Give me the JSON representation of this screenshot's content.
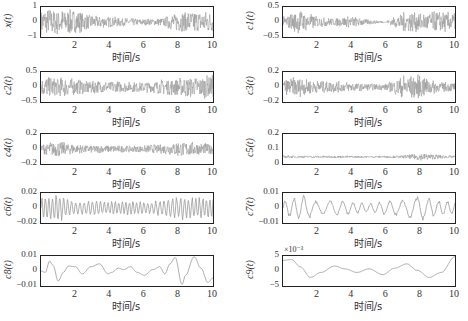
{
  "chart_data": [
    {
      "id": "x",
      "type": "line",
      "ylabel": "x(t)",
      "yticks": [
        "1",
        "0",
        "-1"
      ],
      "ylim": [
        -1,
        1
      ],
      "xlabel": "时间/s",
      "xticks": [
        "2",
        "4",
        "6",
        "8",
        "10"
      ],
      "xlim": [
        0,
        10
      ],
      "noise": 0.8,
      "kind": "noise",
      "env": [
        1,
        1,
        0.9,
        0.5,
        0.4,
        0.3,
        0.25,
        0.3,
        0.8,
        0.9,
        0.8
      ]
    },
    {
      "id": "c1",
      "type": "line",
      "ylabel": "c1(t)",
      "yticks": [
        "0.5",
        "0",
        "-0.5"
      ],
      "ylim": [
        -0.5,
        0.5
      ],
      "xlabel": "时间/s",
      "xticks": [
        "2",
        "4",
        "6",
        "8",
        "10"
      ],
      "xlim": [
        0,
        10
      ],
      "kind": "noise",
      "env": [
        0.4,
        0.9,
        0.4,
        0.3,
        0.45,
        0.2,
        0.05,
        0.8,
        0.7,
        0.8,
        0.7
      ]
    },
    {
      "id": "c2",
      "type": "line",
      "ylabel": "c2(t)",
      "yticks": [
        "0.5",
        "0",
        "-0.5"
      ],
      "ylim": [
        -0.5,
        0.5
      ],
      "xlabel": "时间/s",
      "xticks": [
        "2",
        "4",
        "6",
        "8",
        "10"
      ],
      "xlim": [
        0,
        10
      ],
      "kind": "noise",
      "env": [
        0.7,
        0.8,
        0.6,
        0.5,
        0.45,
        0.4,
        0.4,
        0.55,
        0.7,
        0.8,
        0.9
      ]
    },
    {
      "id": "c3",
      "type": "line",
      "ylabel": "c3(t)",
      "yticks": [
        "0.2",
        "0",
        "-0.2"
      ],
      "ylim": [
        -0.2,
        0.2
      ],
      "xlabel": "时间/s",
      "xticks": [
        "2",
        "4",
        "6",
        "8",
        "10"
      ],
      "xlim": [
        0,
        10
      ],
      "kind": "noise",
      "env": [
        0.6,
        0.8,
        0.5,
        0.45,
        0.35,
        0.25,
        0.25,
        0.9,
        0.9,
        0.4,
        0.35
      ]
    },
    {
      "id": "c4",
      "type": "line",
      "ylabel": "c4(t)",
      "yticks": [
        "0.2",
        "0",
        "-0.2"
      ],
      "ylim": [
        -0.2,
        0.2
      ],
      "xlabel": "时间/s",
      "xticks": [
        "2",
        "4",
        "6",
        "8",
        "10"
      ],
      "xlim": [
        0,
        10
      ],
      "kind": "noise",
      "env": [
        0.4,
        0.6,
        0.35,
        0.3,
        0.3,
        0.25,
        0.3,
        0.35,
        0.6,
        0.5,
        0.4
      ]
    },
    {
      "id": "c5",
      "type": "line",
      "ylabel": "c5(t)",
      "yticks": [
        "0.2",
        "0.1",
        "0"
      ],
      "ylim": [
        0,
        0.2
      ],
      "xlabel": "时间/s",
      "xticks": [
        "2",
        "4",
        "6",
        "8",
        "10"
      ],
      "xlim": [
        0,
        10
      ],
      "kind": "noise_offset",
      "offset": 0.045,
      "env": [
        0.2,
        0.15,
        0.15,
        0.15,
        0.15,
        0.12,
        0.15,
        0.2,
        0.5,
        0.3,
        0.15
      ]
    },
    {
      "id": "c6",
      "type": "line",
      "ylabel": "c6(t)",
      "yticks": [
        "0.02",
        "0",
        "-0.02"
      ],
      "ylim": [
        -0.02,
        0.02
      ],
      "xlabel": "时间/s",
      "xticks": [
        "2",
        "4",
        "6",
        "8",
        "10"
      ],
      "xlim": [
        0,
        10
      ],
      "kind": "osc",
      "freq": 4.5,
      "env": [
        0.9,
        1,
        0.5,
        0.55,
        0.5,
        0.5,
        0.45,
        0.6,
        0.9,
        0.8,
        0.85
      ]
    },
    {
      "id": "c7",
      "type": "line",
      "ylabel": "c7(t)",
      "yticks": [
        "0.01",
        "0",
        "-0.01"
      ],
      "ylim": [
        -0.01,
        0.01
      ],
      "xlabel": "时间/s",
      "xticks": [
        "2",
        "4",
        "6",
        "8",
        "10"
      ],
      "xlim": [
        0,
        10
      ],
      "kind": "osc",
      "freq": 1.6,
      "env": [
        0.5,
        1,
        0.5,
        0.6,
        0.45,
        0.35,
        0.55,
        0.6,
        0.95,
        0.6,
        0.5
      ]
    },
    {
      "id": "c8",
      "type": "line",
      "ylabel": "c8(t)",
      "yticks": [
        "0.01",
        "0",
        "-0.01"
      ],
      "ylim": [
        -0.01,
        0.01
      ],
      "xlabel": "时间/s",
      "xticks": [
        "2",
        "4",
        "6",
        "8",
        "10"
      ],
      "xlim": [
        0,
        10
      ],
      "kind": "points",
      "pts": [
        [
          0,
          0
        ],
        [
          0.25,
          -0.1
        ],
        [
          0.5,
          0.7
        ],
        [
          0.7,
          0.4
        ],
        [
          1.0,
          -0.7
        ],
        [
          1.3,
          -0.1
        ],
        [
          1.6,
          0.35
        ],
        [
          2.0,
          0.3
        ],
        [
          2.4,
          -0.2
        ],
        [
          2.9,
          0.3
        ],
        [
          3.4,
          0.5
        ],
        [
          3.9,
          -0.2
        ],
        [
          4.1,
          -0.1
        ],
        [
          4.5,
          0.2
        ],
        [
          4.8,
          0.1
        ],
        [
          5.2,
          0.3
        ],
        [
          5.6,
          -0.1
        ],
        [
          6.0,
          -0.3
        ],
        [
          6.5,
          0.1
        ],
        [
          6.9,
          0.3
        ],
        [
          7.2,
          -0.2
        ],
        [
          7.5,
          0.5
        ],
        [
          7.8,
          0.95
        ],
        [
          8.2,
          -0.95
        ],
        [
          8.4,
          -0.3
        ],
        [
          8.9,
          1.0
        ],
        [
          9.3,
          0.2
        ],
        [
          9.7,
          -0.8
        ],
        [
          10,
          -0.5
        ]
      ]
    },
    {
      "id": "c9",
      "type": "line",
      "ylabel": "c9(t)",
      "yticks": [
        "5",
        "0",
        "-5"
      ],
      "ylim": [
        -5,
        5
      ],
      "multiplier": "×10⁻³",
      "xlabel": "时间/s",
      "xticks": [
        "2",
        "4",
        "6",
        "8",
        "10"
      ],
      "xlim": [
        0,
        10
      ],
      "kind": "points",
      "pts": [
        [
          0,
          0.75
        ],
        [
          0.5,
          0.8
        ],
        [
          1.0,
          0.3
        ],
        [
          1.6,
          -0.45
        ],
        [
          2.2,
          -0.1
        ],
        [
          3.0,
          0.35
        ],
        [
          3.6,
          0.15
        ],
        [
          4.3,
          -0.1
        ],
        [
          5.0,
          0.15
        ],
        [
          5.8,
          -0.25
        ],
        [
          6.5,
          0.2
        ],
        [
          7.2,
          0.5
        ],
        [
          7.8,
          0.05
        ],
        [
          8.5,
          -0.45
        ],
        [
          9.2,
          -0.1
        ],
        [
          10,
          1.0
        ]
      ]
    }
  ],
  "layout_order": {
    "left": [
      "x",
      "c2",
      "c4",
      "c6",
      "c8"
    ],
    "right": [
      "c1",
      "c3",
      "c5",
      "c7",
      "c9"
    ]
  }
}
